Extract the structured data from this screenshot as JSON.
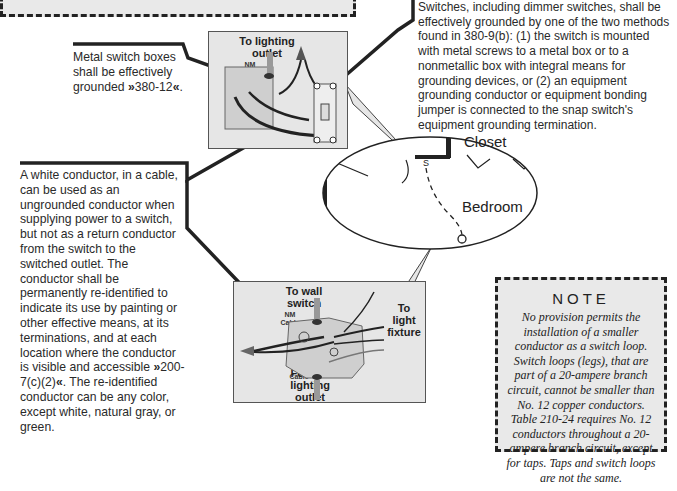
{
  "top_note": {
    "visible_text": ""
  },
  "callouts": {
    "metal_boxes": {
      "text": "Metal switch boxes shall be effectively grounded",
      "reference": "380-12",
      "suffix": "."
    },
    "switch_grounding": {
      "text": "Switches, including dimmer switches, shall be effectively grounded by one of the two methods found in 380-9(b): (1) the switch is mounted with metal screws to a metal box or to a nonmetallic box with integral means for grounding devices, or (2) an equipment grounding conductor or equipment bonding jumper is connected to the snap switch's equipment grounding termination."
    },
    "white_conductor": {
      "text_before": "A white conductor, in a cable, can be used as an ungrounded conductor when supplying power to a switch, but not as a return conductor from the switch to the switched outlet. The conductor shall be permanently re-identified to indicate its use by painting or other effective means, at its terminations, and at each location where the conductor is visible and accessible",
      "reference": "200-7(c)(2)",
      "text_after": ". The re-identified conductor can be any color, except white, natural gray, or green."
    }
  },
  "ref_markers": {
    "open": "»",
    "close": "«"
  },
  "photos": {
    "switch_box": {
      "label_top_line1": "To lighting",
      "label_top_line2": "outlet",
      "nm_line1": "NM",
      "nm_line2": "Cable"
    },
    "outlet_box": {
      "label_top_line1": "To wall",
      "label_top_line2": "switch",
      "nm_top_line1": "NM",
      "nm_top_line2": "Cable",
      "label_right_line1": "To",
      "label_right_line2": "light",
      "label_right_line3": "fixture",
      "nm_bottom_line1": "NM",
      "nm_bottom_line2": "Cable",
      "label_bottom_line1": "Feed to",
      "label_bottom_line2": "lighting",
      "label_bottom_line3": "outlet"
    }
  },
  "floor_plan": {
    "room1": "Closet",
    "room2": "Bedroom",
    "switch_symbol": "S"
  },
  "note": {
    "title": "NOTE",
    "body": "No provision permits the installation of a smaller conductor as a switch loop. Switch loops (legs), that are part of a 20-ampere branch circuit, cannot be smaller than No. 12 copper conductors. Table 210-24 requires No. 12 conductors throughout a 20-ampere branch circuit, except for taps. Taps and switch loops are not the same."
  },
  "colors": {
    "panel_gray": "#e9e9e9",
    "line_black": "#222222",
    "photo_gray": "#e6e6e6"
  }
}
